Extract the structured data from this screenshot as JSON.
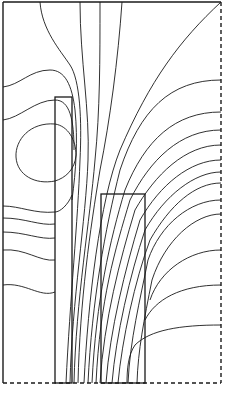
{
  "diagram": {
    "type": "field-contour-plot",
    "colors": {
      "background": "#ffffff",
      "line": "#1a1a1a"
    },
    "boundary": {
      "left": "solid",
      "top": "solid",
      "right": "dashed",
      "bottom": "dashed",
      "x": 3,
      "y": 2,
      "width": 218,
      "height": 381
    },
    "regions": [
      {
        "name": "tall-slab",
        "x": 55,
        "y": 97,
        "width": 17,
        "height": 286
      },
      {
        "name": "short-block",
        "x": 101,
        "y": 194,
        "width": 44,
        "height": 189
      }
    ]
  }
}
